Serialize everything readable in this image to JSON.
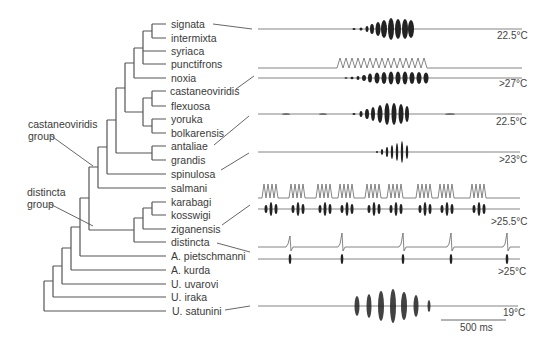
{
  "figure": {
    "type": "phylogeny-with-song-oscillograms",
    "taxa": [
      {
        "name": "signata",
        "y": 24
      },
      {
        "name": "intermixta",
        "y": 38
      },
      {
        "name": "syriaca",
        "y": 51
      },
      {
        "name": "punctifrons",
        "y": 64
      },
      {
        "name": "noxia",
        "y": 78
      },
      {
        "name": "castaneoviridis",
        "y": 91
      },
      {
        "name": "flexuosa",
        "y": 106
      },
      {
        "name": "yoruka",
        "y": 119
      },
      {
        "name": "bolkarensis",
        "y": 133
      },
      {
        "name": "antaliae",
        "y": 146
      },
      {
        "name": "grandis",
        "y": 160
      },
      {
        "name": "spinulosa",
        "y": 174
      },
      {
        "name": "salmani",
        "y": 188
      },
      {
        "name": "karabagi",
        "y": 202
      },
      {
        "name": "kosswigi",
        "y": 215
      },
      {
        "name": "ziganensis",
        "y": 229
      },
      {
        "name": "distincta",
        "y": 242
      },
      {
        "name": "A. pietschmanni",
        "y": 256
      },
      {
        "name": "A. kurda",
        "y": 270
      },
      {
        "name": "U. uvarovi",
        "y": 284
      },
      {
        "name": "U. iraka",
        "y": 297
      },
      {
        "name": "U. satunini",
        "y": 311
      }
    ],
    "groups": [
      {
        "label_line1": "castaneoviridis",
        "label_line2": "group"
      },
      {
        "label_line1": "distincta",
        "label_line2": "group"
      }
    ],
    "oscillograms": [
      {
        "taxon": "signata",
        "temperature": "22.5°C",
        "traces": 1
      },
      {
        "taxon": "punctifrons",
        "temperature": ">27°C",
        "traces": 2
      },
      {
        "taxon": "castaneoviridis",
        "temperature": ">27°C",
        "traces": 2
      },
      {
        "taxon": "bolkarensis",
        "temperature": "22.5°C",
        "traces": 1
      },
      {
        "taxon": "spinulosa",
        "temperature": ">23°C",
        "traces": 1
      },
      {
        "taxon": "ziganensis",
        "temperature": ">25.5°C",
        "traces": 2
      },
      {
        "taxon": "distincta",
        "temperature": ">25°C",
        "traces": 2
      },
      {
        "taxon": "U. satunini",
        "temperature": "19°C",
        "traces": 1
      }
    ],
    "temps": {
      "t1": "22.5°C",
      "t2": ">27°C",
      "t3": "22.5°C",
      "t4": ">23°C",
      "t5": ">25.5°C",
      "t6": ">25°C",
      "t7": "19°C"
    },
    "scale_bar": {
      "label": "500 ms"
    }
  }
}
